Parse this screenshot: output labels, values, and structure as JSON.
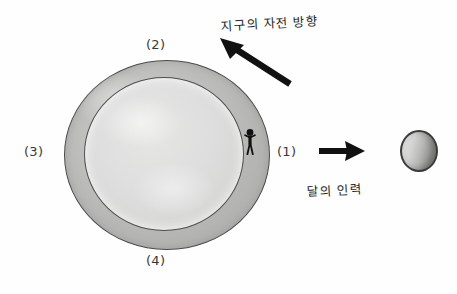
{
  "diagram": {
    "title_texts": {
      "earth_rotation_direction": "지구의 자전 방향",
      "moon_gravity": "달의 인력"
    },
    "position_labels": {
      "right": "(1)",
      "top": "(2)",
      "left": "(3)",
      "bottom": "(4)"
    },
    "objects": {
      "earth_name": "earth",
      "moon_name": "moon",
      "observer_name": "observer-person"
    },
    "colors": {
      "background": "#fefefe",
      "earth_outer_ring": "#b3b3b1",
      "earth_inner": "#dedede",
      "moon_light": "#d4d4d2",
      "moon_dark": "#7d7d7b",
      "ink": "#262626",
      "outline": "#4a4a4a"
    }
  }
}
